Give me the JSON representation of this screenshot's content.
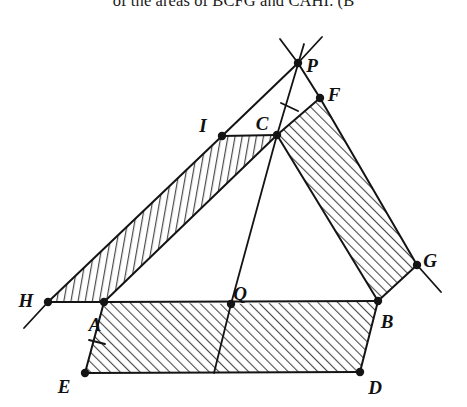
{
  "caption": {
    "text": "of the areas of BCFG and CAHI. (B"
  },
  "figure": {
    "background": "#ffffff",
    "stroke_color": "#141414",
    "hatch_color": "#4a4a4a",
    "point_radius": 4.2,
    "vertices": [
      {
        "id": "P",
        "x": 298,
        "y": 48,
        "lx": 312,
        "ly": 53,
        "dot": true
      },
      {
        "id": "F",
        "x": 320,
        "y": 83,
        "lx": 334,
        "ly": 82,
        "dot": true
      },
      {
        "id": "C",
        "x": 277,
        "y": 120,
        "lx": 262,
        "ly": 111,
        "dot": true
      },
      {
        "id": "I",
        "x": 222,
        "y": 121,
        "lx": 203,
        "ly": 113,
        "dot": true
      },
      {
        "id": "H",
        "x": 48,
        "y": 287,
        "lx": 26,
        "ly": 288,
        "dot": true
      },
      {
        "id": "A",
        "x": 104,
        "y": 287,
        "lx": 95,
        "ly": 312,
        "dot": true
      },
      {
        "id": "Q",
        "x": 231,
        "y": 289,
        "lx": 240,
        "ly": 281,
        "dot": true
      },
      {
        "id": "B",
        "x": 378,
        "y": 286,
        "lx": 387,
        "ly": 309,
        "dot": true
      },
      {
        "id": "G",
        "x": 417,
        "y": 250,
        "lx": 430,
        "ly": 248,
        "dot": true
      },
      {
        "id": "E",
        "x": 85,
        "y": 358,
        "lx": 64,
        "ly": 374,
        "dot": true
      },
      {
        "id": "D",
        "x": 360,
        "y": 357,
        "lx": 375,
        "ly": 375,
        "dot": true
      }
    ],
    "regions": [
      {
        "id": "BCFG",
        "name": "parallelogram-bcfg",
        "points": "277,120 320,83 417,250 378,286",
        "hatch": "hatch-diag-right"
      },
      {
        "id": "CAHI",
        "name": "parallelogram-cahi",
        "points": "277,120 222,121 48,287 104,287",
        "hatch": "hatch-steep"
      },
      {
        "id": "AQ-E",
        "name": "parallelogram-abde-left",
        "points": "104,287 231,289 214,358 85,358",
        "hatch": "hatch-diag-right"
      },
      {
        "id": "QB-D",
        "name": "parallelogram-abde-right",
        "points": "231,289 378,286 360,357 214,358",
        "hatch": "hatch-diag-right"
      }
    ],
    "segments": [
      {
        "id": "AB",
        "name": "segment-ab",
        "x1": 104,
        "y1": 287,
        "x2": 378,
        "y2": 286,
        "w": 2.0
      },
      {
        "id": "BC",
        "name": "segment-bc",
        "x1": 378,
        "y1": 286,
        "x2": 277,
        "y2": 120,
        "w": 2.0
      },
      {
        "id": "CA",
        "name": "segment-ca",
        "x1": 277,
        "y1": 120,
        "x2": 104,
        "y2": 287,
        "w": 2.0
      },
      {
        "id": "CF",
        "name": "segment-cf",
        "x1": 277,
        "y1": 120,
        "x2": 320,
        "y2": 83,
        "w": 2.0
      },
      {
        "id": "FG",
        "name": "segment-fg",
        "x1": 320,
        "y1": 83,
        "x2": 417,
        "y2": 250,
        "w": 2.0
      },
      {
        "id": "GB",
        "name": "segment-gb",
        "x1": 417,
        "y1": 250,
        "x2": 378,
        "y2": 286,
        "w": 2.0
      },
      {
        "id": "CI",
        "name": "segment-ci",
        "x1": 277,
        "y1": 120,
        "x2": 222,
        "y2": 121,
        "w": 2.0
      },
      {
        "id": "IH",
        "name": "segment-ih",
        "x1": 222,
        "y1": 121,
        "x2": 48,
        "y2": 287,
        "w": 2.0
      },
      {
        "id": "HA",
        "name": "segment-ha",
        "x1": 48,
        "y1": 287,
        "x2": 104,
        "y2": 287,
        "w": 2.0
      },
      {
        "id": "AE",
        "name": "segment-ae",
        "x1": 104,
        "y1": 287,
        "x2": 85,
        "y2": 358,
        "w": 2.0
      },
      {
        "id": "ED",
        "name": "segment-ed",
        "x1": 85,
        "y1": 358,
        "x2": 360,
        "y2": 357,
        "w": 2.0
      },
      {
        "id": "DB",
        "name": "segment-db",
        "x1": 360,
        "y1": 357,
        "x2": 378,
        "y2": 286,
        "w": 2.0
      },
      {
        "id": "QR",
        "name": "segment-q-to-base",
        "x1": 231,
        "y1": 289,
        "x2": 214,
        "y2": 358,
        "w": 1.8
      },
      {
        "id": "CQ",
        "name": "segment-cq",
        "x1": 277,
        "y1": 120,
        "x2": 231,
        "y2": 289,
        "w": 1.8
      },
      {
        "id": "CP",
        "name": "segment-cp-extended",
        "x1": 277,
        "y1": 120,
        "x2": 304,
        "y2": 29,
        "w": 1.8
      },
      {
        "id": "IP",
        "name": "segment-ip-to-p",
        "x1": 222,
        "y1": 121,
        "x2": 298,
        "y2": 48,
        "w": 2.0
      },
      {
        "id": "FP",
        "name": "segment-fp-to-p",
        "x1": 320,
        "y1": 83,
        "x2": 298,
        "y2": 48,
        "w": 2.0
      },
      {
        "id": "HX",
        "name": "ray-h-extended",
        "x1": 48,
        "y1": 287,
        "x2": 24,
        "y2": 313,
        "w": 1.8
      },
      {
        "id": "GX",
        "name": "ray-g-extended",
        "x1": 417,
        "y1": 250,
        "x2": 441,
        "y2": 277,
        "w": 1.8
      },
      {
        "id": "PA",
        "name": "ray-p-up-left",
        "x1": 298,
        "y1": 48,
        "x2": 280,
        "y2": 24,
        "w": 1.8
      },
      {
        "id": "PB",
        "name": "ray-p-up-right",
        "x1": 298,
        "y1": 48,
        "x2": 322,
        "y2": 22,
        "w": 1.8
      }
    ],
    "ticks": [
      {
        "id": "tick-cp",
        "name": "tick-mark-cp",
        "x1": 281,
        "y1": 88,
        "x2": 298,
        "y2": 96
      },
      {
        "id": "tick-ae",
        "name": "tick-mark-ae",
        "x1": 89,
        "y1": 325,
        "x2": 105,
        "y2": 329
      }
    ]
  }
}
